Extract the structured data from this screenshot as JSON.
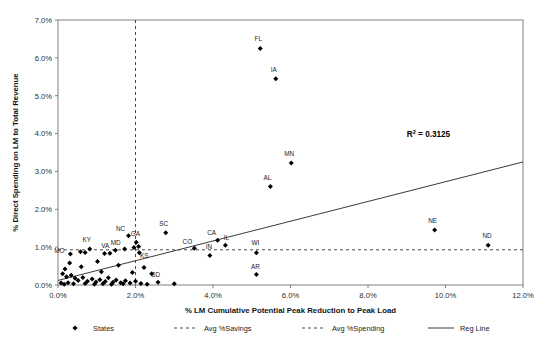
{
  "chart_data": {
    "type": "scatter",
    "title": "",
    "xlabel": "% LM Cumulative Potential Peak Reduction to Peak Load",
    "ylabel": "% Direct Spending on LM to Total Revenue",
    "xlim": [
      0,
      12
    ],
    "ylim": [
      0,
      7
    ],
    "xticks": [
      "0.0%",
      "2.0%",
      "4.0%",
      "6.0%",
      "8.0%",
      "10.0%",
      "12.0%"
    ],
    "xtick_values": [
      0,
      2,
      4,
      6,
      8,
      10,
      12
    ],
    "yticks": [
      "0.0%",
      "1.0%",
      "2.0%",
      "3.0%",
      "4.0%",
      "5.0%",
      "6.0%",
      "7.0%"
    ],
    "ytick_values": [
      0,
      1,
      2,
      3,
      4,
      5,
      6,
      7
    ],
    "grid": false,
    "legend_position": "bottom",
    "annotations": [
      {
        "name": "r-squared",
        "text": "R",
        "sup": "2",
        "rest": " = 0.3125",
        "x": 9.0,
        "y": 3.9
      }
    ],
    "series": [
      {
        "name": "States",
        "marker": "diamond",
        "color": "#000000",
        "points": [
          {
            "label": "FL",
            "x": 5.22,
            "y": 6.25,
            "lx": -2,
            "ly": -7
          },
          {
            "label": "IA",
            "x": 5.62,
            "y": 5.45,
            "lx": -2,
            "ly": -7
          },
          {
            "label": "MN",
            "x": 6.02,
            "y": 3.22,
            "lx": -2,
            "ly": -7
          },
          {
            "label": "AL",
            "x": 5.48,
            "y": 2.6,
            "lx": -3,
            "ly": -7
          },
          {
            "label": "NE",
            "x": 9.72,
            "y": 1.45,
            "lx": -2,
            "ly": -7
          },
          {
            "label": "ND",
            "x": 11.1,
            "y": 1.05,
            "lx": -1,
            "ly": -7
          },
          {
            "label": "SC",
            "x": 2.78,
            "y": 1.38,
            "lx": -2,
            "ly": -7
          },
          {
            "label": "NC",
            "x": 1.82,
            "y": 1.3,
            "lx": -8,
            "ly": -5
          },
          {
            "label": "GA",
            "x": 2.02,
            "y": 1.13,
            "lx": -1,
            "ly": -6
          },
          {
            "label": "CA",
            "x": 4.12,
            "y": 1.18,
            "lx": -6,
            "ly": -5
          },
          {
            "label": "IL",
            "x": 4.32,
            "y": 1.05,
            "lx": 1,
            "ly": -5
          },
          {
            "label": "CO",
            "x": 3.52,
            "y": 0.97,
            "lx": -7,
            "ly": -4
          },
          {
            "label": "IN",
            "x": 3.92,
            "y": 0.78,
            "lx": -1,
            "ly": -6
          },
          {
            "label": "WI",
            "x": 5.12,
            "y": 0.85,
            "lx": -1,
            "ly": -8
          },
          {
            "label": "AR",
            "x": 5.12,
            "y": 0.28,
            "lx": -1,
            "ly": -5
          },
          {
            "label": "SD",
            "x": 2.42,
            "y": 0.3,
            "lx": 4,
            "ly": 3
          },
          {
            "label": "KY",
            "x": 0.82,
            "y": 0.95,
            "lx": -3,
            "ly": -7
          },
          {
            "label": "VA",
            "x": 1.48,
            "y": 0.92,
            "lx": -10,
            "ly": -2
          },
          {
            "label": "MD",
            "x": 1.72,
            "y": 0.95,
            "lx": -9,
            "ly": -4
          },
          {
            "label": "MO",
            "x": 0.32,
            "y": 0.82,
            "lx": -11,
            "ly": -1
          },
          {
            "label": "KS",
            "x": 2.1,
            "y": 0.85,
            "lx": 5,
            "ly": 5
          },
          {
            "label": "",
            "x": 0.58,
            "y": 0.88,
            "lx": 0,
            "ly": 0
          },
          {
            "label": "",
            "x": 0.7,
            "y": 0.86,
            "lx": 0,
            "ly": 0
          },
          {
            "label": "",
            "x": 1.2,
            "y": 0.83,
            "lx": 0,
            "ly": 0
          },
          {
            "label": "",
            "x": 1.34,
            "y": 0.84,
            "lx": 0,
            "ly": 0
          },
          {
            "label": "",
            "x": 2.08,
            "y": 1.02,
            "lx": 0,
            "ly": 0
          },
          {
            "label": "",
            "x": 1.96,
            "y": 0.99,
            "lx": 0,
            "ly": 0
          },
          {
            "label": "",
            "x": 0.3,
            "y": 0.58,
            "lx": 0,
            "ly": 0
          },
          {
            "label": "",
            "x": 0.18,
            "y": 0.42,
            "lx": 0,
            "ly": 0
          },
          {
            "label": "",
            "x": 0.6,
            "y": 0.48,
            "lx": 0,
            "ly": 0
          },
          {
            "label": "",
            "x": 1.02,
            "y": 0.62,
            "lx": 0,
            "ly": 0
          },
          {
            "label": "",
            "x": 1.12,
            "y": 0.35,
            "lx": 0,
            "ly": 0
          },
          {
            "label": "",
            "x": 1.56,
            "y": 0.52,
            "lx": 0,
            "ly": 0
          },
          {
            "label": "",
            "x": 1.92,
            "y": 0.33,
            "lx": 0,
            "ly": 0
          },
          {
            "label": "",
            "x": 2.22,
            "y": 0.46,
            "lx": 0,
            "ly": 0
          },
          {
            "label": "",
            "x": 0.12,
            "y": 0.3,
            "lx": 0,
            "ly": 0
          },
          {
            "label": "",
            "x": 0.22,
            "y": 0.22,
            "lx": 0,
            "ly": 0
          },
          {
            "label": "",
            "x": 0.34,
            "y": 0.26,
            "lx": 0,
            "ly": 0
          },
          {
            "label": "",
            "x": 0.44,
            "y": 0.18,
            "lx": 0,
            "ly": 0
          },
          {
            "label": "",
            "x": 0.52,
            "y": 0.12,
            "lx": 0,
            "ly": 0
          },
          {
            "label": "",
            "x": 0.64,
            "y": 0.2,
            "lx": 0,
            "ly": 0
          },
          {
            "label": "",
            "x": 0.76,
            "y": 0.1,
            "lx": 0,
            "ly": 0
          },
          {
            "label": "",
            "x": 0.88,
            "y": 0.16,
            "lx": 0,
            "ly": 0
          },
          {
            "label": "",
            "x": 0.98,
            "y": 0.08,
            "lx": 0,
            "ly": 0
          },
          {
            "label": "",
            "x": 1.08,
            "y": 0.14,
            "lx": 0,
            "ly": 0
          },
          {
            "label": "",
            "x": 1.22,
            "y": 0.09,
            "lx": 0,
            "ly": 0
          },
          {
            "label": "",
            "x": 1.3,
            "y": 0.19,
            "lx": 0,
            "ly": 0
          },
          {
            "label": "",
            "x": 1.42,
            "y": 0.07,
            "lx": 0,
            "ly": 0
          },
          {
            "label": "",
            "x": 1.5,
            "y": 0.13,
            "lx": 0,
            "ly": 0
          },
          {
            "label": "",
            "x": 1.62,
            "y": 0.06,
            "lx": 0,
            "ly": 0
          },
          {
            "label": "",
            "x": 1.74,
            "y": 0.11,
            "lx": 0,
            "ly": 0
          },
          {
            "label": "",
            "x": 1.86,
            "y": 0.05,
            "lx": 0,
            "ly": 0
          },
          {
            "label": "",
            "x": 2.0,
            "y": 0.1,
            "lx": 0,
            "ly": 0
          },
          {
            "label": "",
            "x": 2.14,
            "y": 0.04,
            "lx": 0,
            "ly": 0
          },
          {
            "label": "",
            "x": 0.08,
            "y": 0.05,
            "lx": 0,
            "ly": 0
          },
          {
            "label": "",
            "x": 0.16,
            "y": 0.02,
            "lx": 0,
            "ly": 0
          },
          {
            "label": "",
            "x": 0.26,
            "y": 0.06,
            "lx": 0,
            "ly": 0
          },
          {
            "label": "",
            "x": 0.4,
            "y": 0.03,
            "lx": 0,
            "ly": 0
          },
          {
            "label": "",
            "x": 0.7,
            "y": 0.04,
            "lx": 0,
            "ly": 0
          },
          {
            "label": "",
            "x": 0.94,
            "y": 0.02,
            "lx": 0,
            "ly": 0
          },
          {
            "label": "",
            "x": 1.16,
            "y": 0.03,
            "lx": 0,
            "ly": 0
          },
          {
            "label": "",
            "x": 1.38,
            "y": 0.02,
            "lx": 0,
            "ly": 0
          },
          {
            "label": "",
            "x": 1.68,
            "y": 0.03,
            "lx": 0,
            "ly": 0
          },
          {
            "label": "",
            "x": 2.3,
            "y": 0.02,
            "lx": 0,
            "ly": 0
          },
          {
            "label": "",
            "x": 2.58,
            "y": 0.07,
            "lx": 0,
            "ly": 0
          },
          {
            "label": "",
            "x": 3.0,
            "y": 0.03,
            "lx": 0,
            "ly": 0
          }
        ]
      }
    ],
    "reference_lines": [
      {
        "name": "Avg %Savings",
        "orientation": "vertical",
        "value": 2.0,
        "style": "dashed"
      },
      {
        "name": "Avg %Spending",
        "orientation": "horizontal",
        "value": 0.93,
        "style": "dashed"
      }
    ],
    "regression": {
      "name": "Reg Line",
      "x0": 0.0,
      "y0": 0.12,
      "x1": 12.0,
      "y1": 3.25,
      "r_squared": "0.3125"
    }
  },
  "legend": {
    "items": [
      {
        "label": "States",
        "marker": "diamond"
      },
      {
        "label": "Avg %Savings",
        "marker": "dashed-line"
      },
      {
        "label": "Avg %Spending",
        "marker": "dashed-line"
      },
      {
        "label": "Reg Line",
        "marker": "solid-line"
      }
    ]
  }
}
